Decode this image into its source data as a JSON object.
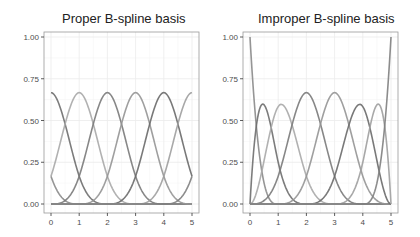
{
  "chart_data": [
    {
      "type": "line",
      "title": "Proper B-spline basis",
      "xlabel": "",
      "ylabel": "",
      "xlim": [
        -0.1,
        5.1
      ],
      "ylim": [
        -0.05,
        1.05
      ],
      "x_ticks": [
        "0",
        "1",
        "2",
        "3",
        "4",
        "5"
      ],
      "y_ticks": [
        "0.00",
        "0.25",
        "0.50",
        "0.75",
        "1.00"
      ],
      "grid": true,
      "legend": "none",
      "description": "Uniform (periodic-style) cubic B-spline basis on [0,5] with knots at integers; interior basis functions peak at 2/3 at x = 0,1,2,3,4,5; value 1/6 at domain boundaries",
      "knots": [
        -3,
        -2,
        -1,
        0,
        1,
        2,
        3,
        4,
        5,
        6,
        7,
        8
      ],
      "series": [
        {
          "name": "B1",
          "peak_x": -1,
          "peak_y": 0.167
        },
        {
          "name": "B2",
          "peak_x": 0,
          "peak_y": 0.667
        },
        {
          "name": "B3",
          "peak_x": 1,
          "peak_y": 0.667
        },
        {
          "name": "B4",
          "peak_x": 2,
          "peak_y": 0.667
        },
        {
          "name": "B5",
          "peak_x": 3,
          "peak_y": 0.667
        },
        {
          "name": "B6",
          "peak_x": 4,
          "peak_y": 0.667
        },
        {
          "name": "B7",
          "peak_x": 5,
          "peak_y": 0.667
        },
        {
          "name": "B8",
          "peak_x": 6,
          "peak_y": 0.167
        }
      ]
    },
    {
      "type": "line",
      "title": "Improper B-spline basis",
      "xlabel": "",
      "ylabel": "",
      "xlim": [
        -0.1,
        5.1
      ],
      "ylim": [
        -0.05,
        1.05
      ],
      "x_ticks": [
        "0",
        "1",
        "2",
        "3",
        "4",
        "5"
      ],
      "y_ticks": [
        "0.00",
        "0.25",
        "0.50",
        "0.75",
        "1.00"
      ],
      "grid": true,
      "legend": "none",
      "description": "Clamped cubic B-spline basis on [0,5] with repeated boundary knots; end basis functions reach 1.00 at x=0 and x=5, interior functions peak ~0.59-0.67",
      "knots": [
        0,
        0,
        0,
        0,
        1,
        2,
        3,
        4,
        5,
        5,
        5,
        5
      ],
      "series": [
        {
          "name": "B1",
          "peak_x": 0.0,
          "peak_y": 1.0
        },
        {
          "name": "B2",
          "peak_x": 0.4,
          "peak_y": 0.59
        },
        {
          "name": "B3",
          "peak_x": 1.1,
          "peak_y": 0.59
        },
        {
          "name": "B4",
          "peak_x": 2.0,
          "peak_y": 0.667
        },
        {
          "name": "B5",
          "peak_x": 3.0,
          "peak_y": 0.667
        },
        {
          "name": "B6",
          "peak_x": 3.9,
          "peak_y": 0.59
        },
        {
          "name": "B7",
          "peak_x": 4.6,
          "peak_y": 0.59
        },
        {
          "name": "B8",
          "peak_x": 5.0,
          "peak_y": 1.0
        }
      ]
    }
  ],
  "panels": [
    {
      "title": "Proper B-spline basis"
    },
    {
      "title": "Improper B-spline basis"
    }
  ],
  "style": {
    "background": "#ffffff",
    "grid_color": "#ebebeb",
    "border_color": "#9a9a9a",
    "tick_label_color": "#4d4d4d",
    "line_colors": [
      "#8a8a8a",
      "#6e6e6e",
      "#a8a8a8",
      "#7a7a7a",
      "#959595",
      "#6a6a6a",
      "#9e9e9e",
      "#7f7f7f"
    ]
  }
}
